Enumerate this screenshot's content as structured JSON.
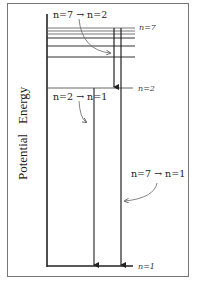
{
  "figure": {
    "type": "energy-level-diagram",
    "y_axis_label": "Potential   Energy",
    "levels": [
      {
        "label": "n=7",
        "y": 28
      },
      {
        "label": "",
        "y": 31
      },
      {
        "label": "",
        "y": 34
      },
      {
        "label": "",
        "y": 38
      },
      {
        "label": "",
        "y": 46
      },
      {
        "label": "",
        "y": 57
      },
      {
        "label": "n=2",
        "y": 88
      },
      {
        "label": "n=1",
        "y": 266
      }
    ],
    "level_labels": {
      "n7": "n=7",
      "n2": "n=2",
      "n1": "n=1"
    },
    "transitions": [
      {
        "label": "n=7 → n=2",
        "from": "n=7",
        "to": "n=2"
      },
      {
        "label": "n=2 → n=1",
        "from": "n=2",
        "to": "n=1"
      },
      {
        "label": "n=7 → n=1",
        "from": "n=7",
        "to": "n=1"
      }
    ]
  }
}
